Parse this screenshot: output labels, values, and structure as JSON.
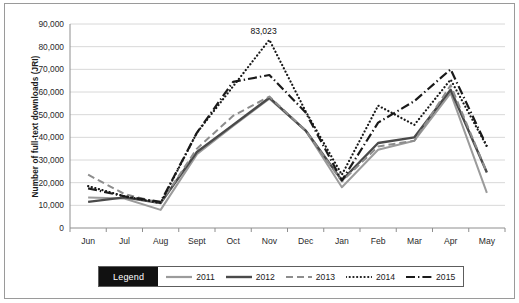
{
  "chart_data": {
    "type": "line",
    "title": "",
    "xlabel": "",
    "ylabel": "Number of full-text downloads (JRI)",
    "categories": [
      "Jun",
      "Jul",
      "Aug",
      "Sept",
      "Oct",
      "Nov",
      "Dec",
      "Jan",
      "Feb",
      "Mar",
      "Apr",
      "May"
    ],
    "ylim": [
      0,
      90000
    ],
    "ytick_labels": [
      "0",
      "10,000",
      "20,000",
      "30,000",
      "40,000",
      "50,000",
      "60,000",
      "70,000",
      "80,000",
      "90,000"
    ],
    "ytick_values": [
      0,
      10000,
      20000,
      30000,
      40000,
      50000,
      60000,
      70000,
      80000,
      90000
    ],
    "grid": "horizontal",
    "legend_position": "bottom",
    "legend_title": "Legend",
    "series": [
      {
        "name": "2011",
        "style": "solid-light",
        "color": "#9b9b9b",
        "width": 2.0,
        "values": [
          13500,
          13000,
          8000,
          32500,
          45000,
          57000,
          43000,
          18000,
          34500,
          38500,
          59500,
          15500
        ]
      },
      {
        "name": "2012",
        "style": "solid-dark",
        "color": "#4a4a4a",
        "width": 2.4,
        "values": [
          11500,
          13500,
          11000,
          33500,
          45500,
          57500,
          43000,
          21000,
          37500,
          40000,
          61000,
          24500
        ]
      },
      {
        "name": "2013",
        "style": "dashed",
        "color": "#8d8d8d",
        "width": 2.0,
        "values": [
          23500,
          15000,
          11000,
          35000,
          49500,
          58000,
          43000,
          20500,
          36000,
          38500,
          63000,
          24500
        ]
      },
      {
        "name": "2014",
        "style": "dotted",
        "color": "#1a1a1a",
        "width": 2.2,
        "values": [
          18500,
          14000,
          11000,
          42000,
          62500,
          83023,
          51500,
          23500,
          54000,
          45500,
          65500,
          36000
        ]
      },
      {
        "name": "2015",
        "style": "dash-dot",
        "color": "#1a1a1a",
        "width": 2.2,
        "values": [
          17500,
          14000,
          11500,
          42000,
          64500,
          67500,
          51000,
          21000,
          46500,
          56000,
          70000,
          36000
        ]
      }
    ],
    "annotations": [
      {
        "text": "83,023",
        "series": "2014",
        "category": "Nov",
        "value": 83023
      }
    ]
  }
}
